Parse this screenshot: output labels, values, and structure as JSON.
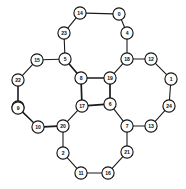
{
  "diagram": {
    "type": "undirected-graph",
    "background_color": "#ffffff",
    "node_fill_color": "#fdfdfd",
    "node_stroke_color": "#141414",
    "edge_color": "#1a1a1a",
    "label_color": "#0d0d0d",
    "node_radius": 6.1,
    "node_count": 25,
    "edge_count": 30,
    "nodes": [
      {
        "id": "0",
        "label": "0",
        "x": 119,
        "y": 14
      },
      {
        "id": "1",
        "label": "1",
        "x": 171,
        "y": 79
      },
      {
        "id": "2",
        "label": "2",
        "x": 63,
        "y": 153
      },
      {
        "id": "3",
        "label": "3",
        "x": 18,
        "y": 107
      },
      {
        "id": "4",
        "label": "4",
        "x": 127,
        "y": 33
      },
      {
        "id": "5",
        "label": "5",
        "x": 65,
        "y": 59
      },
      {
        "id": "6",
        "label": "6",
        "x": 110,
        "y": 104
      },
      {
        "id": "7",
        "label": "7",
        "x": 127,
        "y": 126
      },
      {
        "id": "8",
        "label": "8",
        "x": 81,
        "y": 78
      },
      {
        "id": "9",
        "label": "9",
        "x": 18,
        "y": 108
      },
      {
        "id": "10",
        "label": "10",
        "x": 38,
        "y": 127
      },
      {
        "id": "11",
        "label": "11",
        "x": 81,
        "y": 173
      },
      {
        "id": "12",
        "label": "12",
        "x": 151,
        "y": 59
      },
      {
        "id": "13",
        "label": "13",
        "x": 151,
        "y": 126
      },
      {
        "id": "14",
        "label": "14",
        "x": 80,
        "y": 13
      },
      {
        "id": "15",
        "label": "15",
        "x": 37,
        "y": 60
      },
      {
        "id": "16",
        "label": "16",
        "x": 108,
        "y": 173
      },
      {
        "id": "17",
        "label": "17",
        "x": 82,
        "y": 106
      },
      {
        "id": "18",
        "label": "18",
        "x": 127,
        "y": 59
      },
      {
        "id": "19",
        "label": "19",
        "x": 110,
        "y": 78
      },
      {
        "id": "20",
        "label": "20",
        "x": 63,
        "y": 126
      },
      {
        "id": "21",
        "label": "21",
        "x": 127,
        "y": 152
      },
      {
        "id": "22",
        "label": "22",
        "x": 18,
        "y": 80
      },
      {
        "id": "23",
        "label": "23",
        "x": 64,
        "y": 33
      },
      {
        "id": "24",
        "label": "24",
        "x": 169,
        "y": 106
      }
    ],
    "edges": [
      {
        "source": "14",
        "target": "0",
        "weight": "normal"
      },
      {
        "source": "14",
        "target": "23",
        "weight": "normal"
      },
      {
        "source": "0",
        "target": "4",
        "weight": "normal"
      },
      {
        "source": "23",
        "target": "5",
        "weight": "normal"
      },
      {
        "source": "4",
        "target": "18",
        "weight": "normal"
      },
      {
        "source": "15",
        "target": "5",
        "weight": "normal"
      },
      {
        "source": "15",
        "target": "22",
        "weight": "normal"
      },
      {
        "source": "5",
        "target": "8",
        "weight": "thick"
      },
      {
        "source": "18",
        "target": "12",
        "weight": "normal"
      },
      {
        "source": "18",
        "target": "19",
        "weight": "normal"
      },
      {
        "source": "12",
        "target": "1",
        "weight": "normal"
      },
      {
        "source": "22",
        "target": "9",
        "weight": "normal"
      },
      {
        "source": "8",
        "target": "19",
        "weight": "thick"
      },
      {
        "source": "8",
        "target": "17",
        "weight": "thick"
      },
      {
        "source": "19",
        "target": "6",
        "weight": "thick"
      },
      {
        "source": "1",
        "target": "24",
        "weight": "normal"
      },
      {
        "source": "9",
        "target": "10",
        "weight": "normal"
      },
      {
        "source": "17",
        "target": "6",
        "weight": "thick"
      },
      {
        "source": "17",
        "target": "20",
        "weight": "normal"
      },
      {
        "source": "6",
        "target": "7",
        "weight": "normal"
      },
      {
        "source": "24",
        "target": "13",
        "weight": "normal"
      },
      {
        "source": "10",
        "target": "20",
        "weight": "thick"
      },
      {
        "source": "7",
        "target": "13",
        "weight": "normal"
      },
      {
        "source": "7",
        "target": "21",
        "weight": "normal"
      },
      {
        "source": "20",
        "target": "2",
        "weight": "normal"
      },
      {
        "source": "2",
        "target": "11",
        "weight": "normal"
      },
      {
        "source": "21",
        "target": "16",
        "weight": "normal"
      },
      {
        "source": "11",
        "target": "16",
        "weight": "normal"
      },
      {
        "source": "3",
        "target": "10",
        "weight": "normal"
      },
      {
        "source": "22",
        "target": "3",
        "weight": "normal"
      }
    ]
  }
}
